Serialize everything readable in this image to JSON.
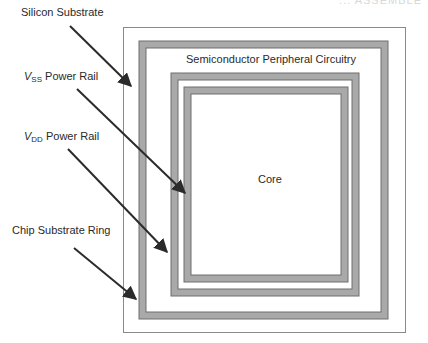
{
  "diagram": {
    "title_fragment": "... ASSEMBLE",
    "labels": {
      "silicon_substrate": "Silicon Substrate",
      "vss_symbol": "V",
      "vss_subscript": "SS",
      "vss_text": " Power Rail",
      "vdd_symbol": "V",
      "vdd_subscript": "DD",
      "vdd_text": " Power Rail",
      "chip_substrate_ring": "Chip Substrate Ring",
      "peripheral": "Semiconductor  Peripheral Circuitry",
      "core": "Core"
    },
    "colors": {
      "ring_fill": "#a9a9a9",
      "ring_edge": "#6e6e6e",
      "outline": "#8a8a8a",
      "arrow": "#2b2b2b",
      "text": "#2a2a2a",
      "background": "#ffffff"
    },
    "structure": [
      {
        "name": "silicon-substrate",
        "type": "thin-outline"
      },
      {
        "name": "chip-substrate-ring",
        "type": "thick-ring"
      },
      {
        "name": "vdd-power-rail",
        "type": "thick-ring"
      },
      {
        "name": "vss-power-rail",
        "type": "thick-ring"
      },
      {
        "name": "core",
        "type": "region"
      }
    ]
  }
}
